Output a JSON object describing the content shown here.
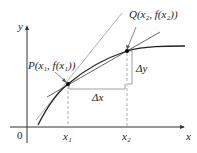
{
  "diagram": {
    "axes": {
      "x_label": "x",
      "y_label": "y",
      "origin_label": "0"
    },
    "points": {
      "P": {
        "label": "P(x₁, f(x₁))"
      },
      "Q": {
        "label": "Q(x₂, f(x₂))"
      }
    },
    "ticks": {
      "x1": "x₁",
      "x2": "x₂"
    },
    "deltas": {
      "dx": "Δx",
      "dy": "Δy"
    },
    "colors": {
      "curve": "#222222",
      "secant": "#555555",
      "tangent": "#b0b0b0",
      "dashed": "#999999"
    }
  }
}
